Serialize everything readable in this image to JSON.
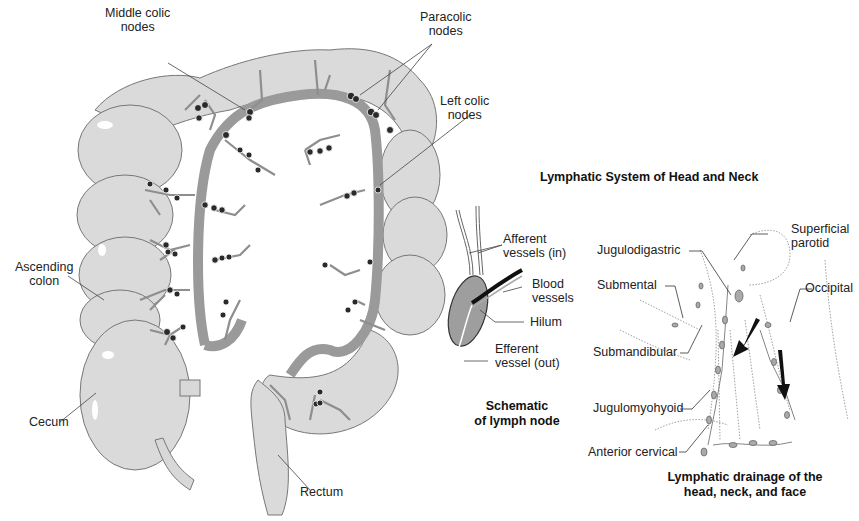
{
  "colon_diagram": {
    "labels": {
      "middle_colic": [
        "Middle colic",
        "nodes"
      ],
      "paracolic": [
        "Paracolic",
        "nodes"
      ],
      "left_colic": [
        "Left colic",
        "nodes"
      ],
      "ascending_colon": [
        "Ascending",
        "colon"
      ],
      "cecum": "Cecum",
      "rectum": "Rectum"
    }
  },
  "lymph_node_schematic": {
    "labels": {
      "afferent": [
        "Afferent",
        "vessels (in)"
      ],
      "blood": [
        "Blood",
        "vessels"
      ],
      "hilum": "Hilum",
      "efferent": [
        "Efferent",
        "vessel (out)"
      ]
    },
    "caption": [
      "Schematic",
      "of lymph node"
    ]
  },
  "head_neck": {
    "title": "Lymphatic System of Head and Neck",
    "labels": {
      "superficial_parotid": [
        "Superficial",
        "parotid"
      ],
      "jugulodigastric": "Jugulodigastric",
      "submental": "Submental",
      "occipital": "Occipital",
      "submandibular": "Submandibular",
      "jugulomyohyoid": "Jugulomyohyoid",
      "anterior_cervical": "Anterior cervical"
    },
    "caption": [
      "Lymphatic drainage of the",
      "head, neck, and face"
    ]
  },
  "colors": {
    "colon_fill": "#dcdcdc",
    "vessel": "#8e8e8e",
    "node": "#2a2a2a",
    "line": "#555555"
  }
}
